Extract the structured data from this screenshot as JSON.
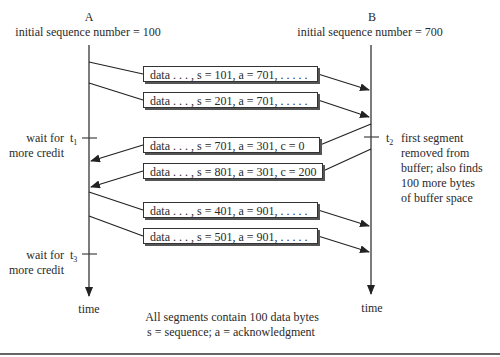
{
  "diagram": {
    "host_a": {
      "name": "A",
      "initial_seq_label": "initial sequence number = 100",
      "time_label": "time"
    },
    "host_b": {
      "name": "B",
      "initial_seq_label": "initial sequence number = 700",
      "time_label": "time"
    },
    "segments": [
      {
        "text": "data . . . , s = 101, a = 701, . . . . .",
        "direction": "A-to-B"
      },
      {
        "text": "data . . . , s = 201, a = 701, . . . . .",
        "direction": "A-to-B"
      },
      {
        "text": "data . . . , s = 701, a = 301, c = 0",
        "direction": "B-to-A"
      },
      {
        "text": "data . . . , s = 801, a = 301, c = 200",
        "direction": "B-to-A"
      },
      {
        "text": "data . . . , s = 401, a = 901, . . . . .",
        "direction": "A-to-B"
      },
      {
        "text": "data . . . , s = 501, a = 901, . . . . .",
        "direction": "A-to-B"
      }
    ],
    "events": {
      "t1": {
        "label": "t",
        "sub": "1",
        "note_line1": "wait for",
        "note_line2": "more credit"
      },
      "t2": {
        "label": "t",
        "sub": "2",
        "note_lines": [
          "first segment",
          "removed from",
          "buffer; also finds",
          "100 more bytes",
          "of buffer space"
        ]
      },
      "t3": {
        "label": "t",
        "sub": "3",
        "note_line1": "wait for",
        "note_line2": "more credit"
      }
    },
    "caption": {
      "line1": "All segments contain 100 data bytes",
      "line2": "s = sequence; a = acknowledgment"
    }
  }
}
